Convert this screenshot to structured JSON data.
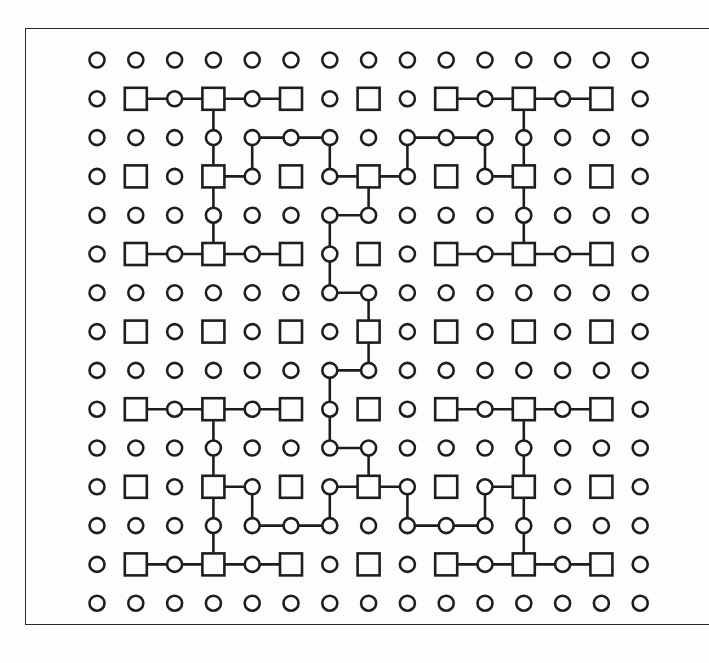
{
  "diagram": {
    "title": "",
    "rows": 15,
    "cols": 15,
    "colors": {
      "ink": "#1e1e1e",
      "paper": "#fdfdfb"
    },
    "node_rule": {
      "square": "row odd AND col odd",
      "circle": "otherwise"
    },
    "paths": [
      [
        [
          1,
          1
        ],
        [
          1,
          2
        ],
        [
          1,
          3
        ],
        [
          1,
          4
        ],
        [
          1,
          5
        ]
      ],
      [
        [
          1,
          3
        ],
        [
          2,
          3
        ],
        [
          3,
          3
        ],
        [
          4,
          3
        ],
        [
          5,
          3
        ]
      ],
      [
        [
          5,
          1
        ],
        [
          5,
          2
        ],
        [
          5,
          3
        ],
        [
          5,
          4
        ],
        [
          5,
          5
        ]
      ],
      [
        [
          3,
          3
        ],
        [
          3,
          4
        ],
        [
          2,
          4
        ],
        [
          2,
          5
        ],
        [
          2,
          6
        ],
        [
          3,
          6
        ],
        [
          3,
          7
        ]
      ],
      [
        [
          1,
          9
        ],
        [
          1,
          10
        ],
        [
          1,
          11
        ],
        [
          1,
          12
        ],
        [
          1,
          13
        ]
      ],
      [
        [
          1,
          11
        ],
        [
          2,
          11
        ],
        [
          3,
          11
        ],
        [
          4,
          11
        ],
        [
          5,
          11
        ]
      ],
      [
        [
          5,
          9
        ],
        [
          5,
          10
        ],
        [
          5,
          11
        ],
        [
          5,
          12
        ],
        [
          5,
          13
        ]
      ],
      [
        [
          3,
          7
        ],
        [
          3,
          8
        ],
        [
          2,
          8
        ],
        [
          2,
          9
        ],
        [
          2,
          10
        ],
        [
          3,
          10
        ],
        [
          3,
          11
        ]
      ],
      [
        [
          3,
          7
        ],
        [
          4,
          7
        ],
        [
          4,
          6
        ],
        [
          5,
          6
        ],
        [
          6,
          6
        ],
        [
          6,
          7
        ],
        [
          7,
          7
        ],
        [
          8,
          7
        ],
        [
          8,
          6
        ],
        [
          9,
          6
        ],
        [
          10,
          6
        ],
        [
          10,
          7
        ],
        [
          11,
          7
        ]
      ],
      [
        [
          9,
          1
        ],
        [
          9,
          2
        ],
        [
          9,
          3
        ],
        [
          9,
          4
        ],
        [
          9,
          5
        ]
      ],
      [
        [
          9,
          3
        ],
        [
          10,
          3
        ],
        [
          11,
          3
        ],
        [
          12,
          3
        ],
        [
          13,
          3
        ]
      ],
      [
        [
          13,
          1
        ],
        [
          13,
          2
        ],
        [
          13,
          3
        ],
        [
          13,
          4
        ],
        [
          13,
          5
        ]
      ],
      [
        [
          11,
          3
        ],
        [
          11,
          4
        ],
        [
          12,
          4
        ],
        [
          12,
          5
        ],
        [
          12,
          6
        ],
        [
          11,
          6
        ],
        [
          11,
          7
        ]
      ],
      [
        [
          9,
          9
        ],
        [
          9,
          10
        ],
        [
          9,
          11
        ],
        [
          9,
          12
        ],
        [
          9,
          13
        ]
      ],
      [
        [
          9,
          11
        ],
        [
          10,
          11
        ],
        [
          11,
          11
        ],
        [
          12,
          11
        ],
        [
          13,
          11
        ]
      ],
      [
        [
          13,
          9
        ],
        [
          13,
          10
        ],
        [
          13,
          11
        ],
        [
          13,
          12
        ],
        [
          13,
          13
        ]
      ],
      [
        [
          11,
          7
        ],
        [
          11,
          8
        ],
        [
          12,
          8
        ],
        [
          12,
          9
        ],
        [
          12,
          10
        ],
        [
          11,
          10
        ],
        [
          11,
          11
        ]
      ]
    ]
  }
}
